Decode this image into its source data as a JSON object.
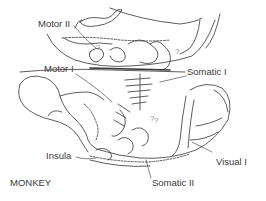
{
  "figure": {
    "subject": "MONKEY",
    "labels": {
      "motor2": "Motor II",
      "motor1": "Motor I",
      "somatic1": "Somatic I",
      "insula": "Insula",
      "visual1": "Visual I",
      "somatic2": "Somatic II"
    },
    "annotations": [
      "?",
      "?",
      "?",
      "?"
    ],
    "line_color": "#333333",
    "background": "#ffffff"
  }
}
